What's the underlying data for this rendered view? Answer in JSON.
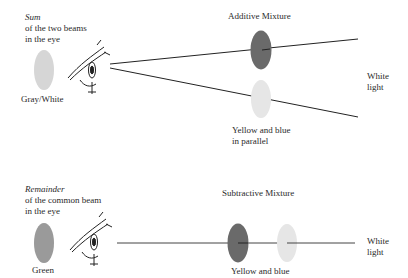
{
  "additive": {
    "title": "Additive Mixture",
    "result_heading": "Sum",
    "result_line1": "of the two beams",
    "result_line2": "in the eye",
    "result_color_label": "Gray/White",
    "filters_line1": "Yellow and blue",
    "filters_line2": "in parallel",
    "source_line1": "White",
    "source_line2": "light",
    "colors": {
      "result": "#d6d6d6",
      "filter_dark": "#6a6a6a",
      "filter_light": "#e6e6e6"
    }
  },
  "subtractive": {
    "title": "Subtractive Mixture",
    "result_heading": "Remainder",
    "result_line1": "of the common beam",
    "result_line2": "in the eye",
    "result_color_label": "Green",
    "filters_line1": "Yellow and blue",
    "source_line1": "White",
    "source_line2": "light",
    "colors": {
      "result": "#9a9a9a",
      "filter_dark": "#6a6a6a",
      "filter_light": "#e6e6e6"
    }
  }
}
